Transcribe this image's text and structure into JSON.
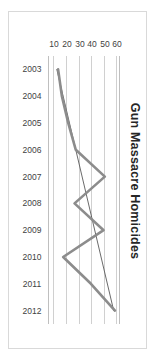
{
  "chart_data": {
    "type": "line",
    "title": "Gun Massacre Homicides",
    "xlabel": "",
    "ylabel": "",
    "orientation": "rotated-90",
    "grid": true,
    "legend": false,
    "categories": [
      "2003",
      "2004",
      "2005",
      "2006",
      "2007",
      "2008",
      "2009",
      "2010",
      "2011",
      "2012"
    ],
    "ylim": [
      5,
      62
    ],
    "yticks": [
      60,
      50,
      40,
      30,
      20,
      10
    ],
    "series": [
      {
        "name": "Gun Massacre Homicides",
        "color": "#8c8c8c",
        "width": 2.6,
        "values": [
          13,
          16,
          21,
          27,
          50,
          26,
          49,
          17,
          39,
          58
        ]
      },
      {
        "name": "Trend",
        "color": "#595959",
        "width": 0.9,
        "type": "trendline",
        "values": [
          12,
          17,
          22,
          27,
          32,
          37,
          42,
          47,
          52,
          57
        ]
      }
    ]
  },
  "axis": {
    "value_labels": [
      "60",
      "50",
      "40",
      "30",
      "20",
      "10"
    ],
    "category_labels": [
      "2003",
      "2004",
      "2005",
      "2006",
      "2007",
      "2008",
      "2009",
      "2010",
      "2011",
      "2012"
    ]
  }
}
